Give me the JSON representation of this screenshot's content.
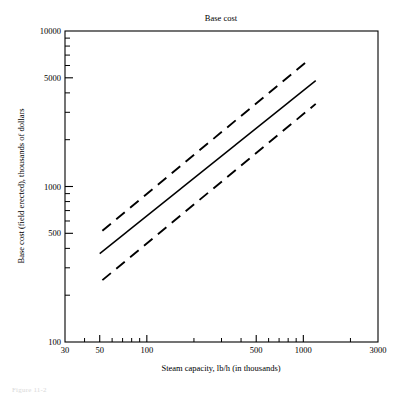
{
  "figure": {
    "caption": "Figure 11-2"
  },
  "chart_data": {
    "type": "line",
    "title": "Base cost",
    "xlabel": "Steam capacity, lb/h (in thousands)",
    "ylabel": "Base cost (field erected), thousands of dollars",
    "xscale": "log",
    "yscale": "log",
    "xlim": [
      30,
      3000
    ],
    "ylim": [
      100,
      10000
    ],
    "grid": false,
    "legend": "none",
    "xticks_labeled": [
      30,
      50,
      100,
      500,
      1000,
      3000
    ],
    "xtick_labels": [
      "30",
      "50",
      "100",
      "500",
      "1000",
      "3000"
    ],
    "xticks_minor": [
      40,
      60,
      70,
      80,
      90,
      200,
      300,
      400,
      600,
      700,
      800,
      900,
      2000
    ],
    "yticks_labeled": [
      100,
      500,
      1000,
      5000,
      10000
    ],
    "ytick_labels": [
      "100",
      "500",
      "1000",
      "5000",
      "10000"
    ],
    "yticks_minor": [
      200,
      300,
      400,
      600,
      700,
      800,
      900,
      2000,
      3000,
      4000,
      6000,
      7000,
      8000,
      9000
    ],
    "series": [
      {
        "name": "base cost (nominal)",
        "style": "solid",
        "color": "#000000",
        "x": [
          50,
          1200
        ],
        "y": [
          370,
          4800
        ]
      },
      {
        "name": "upper bound",
        "style": "dashed",
        "color": "#000000",
        "x": [
          52,
          1100
        ],
        "y": [
          520,
          6600
        ]
      },
      {
        "name": "lower bound",
        "style": "dashed",
        "color": "#000000",
        "x": [
          52,
          1200
        ],
        "y": [
          250,
          3400
        ]
      }
    ]
  }
}
